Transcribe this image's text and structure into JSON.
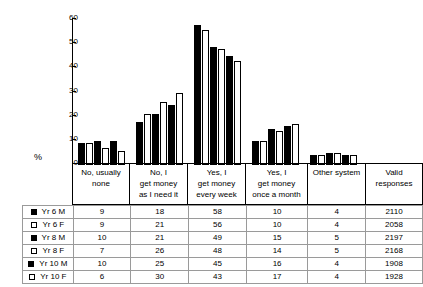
{
  "chart_data": {
    "type": "bar",
    "title": "",
    "subtitle": "",
    "xlabel": "",
    "ylabel": "%",
    "ylim": [
      0,
      60
    ],
    "yticks": [
      0,
      10,
      20,
      30,
      40,
      50,
      60
    ],
    "ytick_labels": [
      "0",
      "10",
      "20",
      "30",
      "40",
      "50",
      "60"
    ],
    "grid": false,
    "legend_position": "table-row-headers",
    "categories": [
      "No, usually none",
      "No, I get money as I need it",
      "Yes, I get money every week",
      "Yes, I get money once a month",
      "Other system"
    ],
    "series": [
      {
        "name": "Yr 6 M",
        "marker": "filled",
        "values": [
          9,
          18,
          58,
          10,
          4
        ]
      },
      {
        "name": "Yr 6 F",
        "marker": "hollow",
        "values": [
          9,
          21,
          56,
          10,
          4
        ]
      },
      {
        "name": "Yr 8 M",
        "marker": "filled",
        "values": [
          10,
          21,
          49,
          15,
          5
        ]
      },
      {
        "name": "Yr 8 F",
        "marker": "hollow",
        "values": [
          7,
          26,
          48,
          14,
          5
        ]
      },
      {
        "name": "Yr 10 M",
        "marker": "filled",
        "values": [
          10,
          25,
          45,
          16,
          4
        ]
      },
      {
        "name": "Yr 10 F",
        "marker": "hollow",
        "values": [
          6,
          30,
          43,
          17,
          4
        ]
      }
    ],
    "valid_responses": [
      2110,
      2058,
      2197,
      2168,
      1908,
      1928
    ],
    "colors": {
      "filled": "#000000",
      "hollow": "#ffffff",
      "outline": "#000000",
      "grid": "#9a9a9a"
    }
  },
  "axis": {
    "y_title": "%",
    "ticks": [
      "60",
      "50",
      "40",
      "30",
      "20",
      "10",
      "0"
    ]
  },
  "headers": {
    "categories": [
      {
        "lines": [
          "No, usually",
          "none"
        ]
      },
      {
        "lines": [
          "No, I",
          "get money",
          "as I need it"
        ]
      },
      {
        "lines": [
          "Yes, I",
          "get money",
          "every week"
        ]
      },
      {
        "lines": [
          "Yes, I",
          "get money",
          "once a month"
        ]
      },
      {
        "lines": [
          "Other system"
        ]
      },
      {
        "lines": [
          "Valid",
          "responses"
        ]
      }
    ]
  },
  "table": {
    "rows": [
      {
        "label": "Yr 6 M",
        "marker": "filled",
        "cells": [
          "9",
          "18",
          "58",
          "10",
          "4",
          "2110"
        ]
      },
      {
        "label": "Yr 6 F",
        "marker": "hollow",
        "cells": [
          "9",
          "21",
          "56",
          "10",
          "4",
          "2058"
        ]
      },
      {
        "label": "Yr 8 M",
        "marker": "filled",
        "cells": [
          "10",
          "21",
          "49",
          "15",
          "5",
          "2197"
        ]
      },
      {
        "label": "Yr 8 F",
        "marker": "hollow",
        "cells": [
          "7",
          "26",
          "48",
          "14",
          "5",
          "2168"
        ]
      },
      {
        "label": "Yr 10 M",
        "marker": "filled",
        "cells": [
          "10",
          "25",
          "45",
          "16",
          "4",
          "1908"
        ]
      },
      {
        "label": "Yr 10 F",
        "marker": "hollow",
        "cells": [
          "6",
          "30",
          "43",
          "17",
          "4",
          "1928"
        ]
      }
    ]
  }
}
